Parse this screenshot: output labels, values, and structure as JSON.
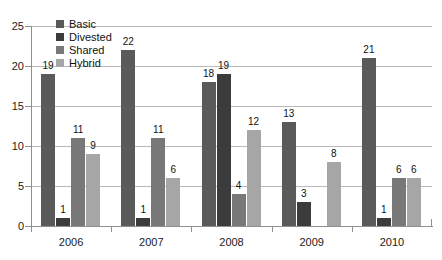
{
  "chart_data": {
    "type": "bar",
    "title": "",
    "subtitle": "",
    "xlabel": "",
    "ylabel": "",
    "categories": [
      "2006",
      "2007",
      "2008",
      "2009",
      "2010"
    ],
    "series": [
      {
        "name": "Basic",
        "color": "#5a5a5a",
        "values": [
          19,
          22,
          18,
          13,
          21
        ]
      },
      {
        "name": "Divested",
        "color": "#3c3c3c",
        "values": [
          1,
          1,
          19,
          3,
          1
        ]
      },
      {
        "name": "Shared",
        "color": "#787878",
        "values": [
          11,
          11,
          4,
          0,
          6
        ]
      },
      {
        "name": "Hybrid",
        "color": "#a6a6a6",
        "values": [
          9,
          6,
          12,
          8,
          6
        ]
      }
    ],
    "ylim": [
      0,
      25
    ],
    "y_ticks": [
      0,
      5,
      10,
      15,
      20,
      25
    ],
    "y_tick_labels": [
      "0",
      "5",
      "10",
      "15",
      "20",
      "25"
    ],
    "grid": true,
    "grid_axis": "y",
    "legend_position": "top-left",
    "data_labels": true,
    "data_label_values": {
      "2006": {
        "Basic": "19",
        "Divested": "1",
        "Shared": "11",
        "Hybrid": "9"
      },
      "2007": {
        "Basic": "22",
        "Divested": "1",
        "Shared": "11",
        "Hybrid": "6"
      },
      "2008": {
        "Basic": "18",
        "Divested": "19",
        "Shared": "4",
        "Hybrid": "12"
      },
      "2009": {
        "Basic": "13",
        "Divested": "3",
        "Shared": "",
        "Hybrid": "8"
      },
      "2010": {
        "Basic": "21",
        "Divested": "1",
        "Shared": "6",
        "Hybrid": "6"
      }
    }
  },
  "legend": {
    "items": [
      {
        "label": "Basic",
        "color": "#5a5a5a"
      },
      {
        "label": "Divested",
        "color": "#3c3c3c"
      },
      {
        "label": "Shared",
        "color": "#787878"
      },
      {
        "label": "Hybrid",
        "color": "#a6a6a6"
      }
    ]
  },
  "axes": {
    "y_tick_labels": [
      "25",
      "20",
      "15",
      "10",
      "5",
      "0"
    ],
    "x_tick_labels": [
      "2006",
      "2007",
      "2008",
      "2009",
      "2010"
    ]
  }
}
